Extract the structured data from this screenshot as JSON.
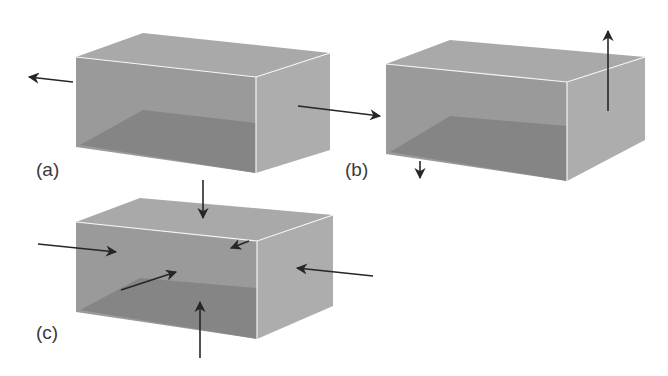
{
  "figure": {
    "panels": [
      {
        "id": "a",
        "label": "(a)",
        "description": "Box under tension along one axis (stretched left and right)",
        "arrows": [
          "outward-left",
          "outward-right"
        ]
      },
      {
        "id": "b",
        "label": "(b)",
        "description": "Box stretched vertically (up from top, down from bottom)",
        "arrows": [
          "outward-up",
          "outward-down"
        ]
      },
      {
        "id": "c",
        "label": "(c)",
        "description": "Box compressed from all sides (hydrostatic pressure)",
        "arrows": [
          "inward-top",
          "inward-bottom",
          "inward-left",
          "inward-right",
          "inward-front",
          "inward-back"
        ]
      }
    ],
    "colors": {
      "top_face": "#a9a9a9",
      "front_face": "#9a9a9a",
      "side_face": "#adadad",
      "floor": "#858585",
      "edge": "#f4f4f4",
      "arrow": "#262626",
      "label": "#3a3a3a"
    }
  }
}
